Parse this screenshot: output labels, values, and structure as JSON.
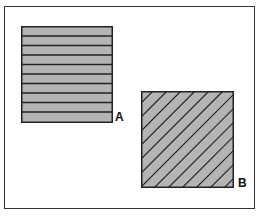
{
  "diagram": {
    "squares": [
      {
        "id": "A",
        "label": "A",
        "pattern": "horizontal-lines",
        "fill": "#b4b4b4",
        "line_color": "#222222",
        "stripes": 10
      },
      {
        "id": "B",
        "label": "B",
        "pattern": "diagonal-lines",
        "fill": "#b4b4b4",
        "line_color": "#222222"
      }
    ]
  }
}
